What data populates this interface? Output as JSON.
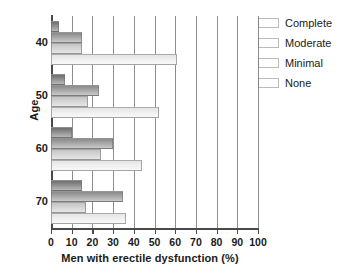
{
  "chart_data": {
    "type": "bar",
    "orientation": "horizontal",
    "title": "",
    "xlabel": "Men with erectile dysfunction (%)",
    "ylabel": "Age",
    "categories": [
      "40",
      "50",
      "60",
      "70"
    ],
    "xlim": [
      0,
      100
    ],
    "xticks": [
      "0",
      "10",
      "20",
      "30",
      "40",
      "50",
      "60",
      "70",
      "80",
      "90",
      "100"
    ],
    "grid": "vertical",
    "legend_position": "top-right",
    "series": [
      {
        "name": "Complete",
        "color": "#8f8f8f",
        "values": [
          4,
          7,
          10,
          15
        ]
      },
      {
        "name": "Moderate",
        "color": "#a6a6a6",
        "values": [
          15,
          23,
          30,
          35
        ]
      },
      {
        "name": "Minimal",
        "color": "#d4d4d4",
        "values": [
          15,
          18,
          24,
          17
        ]
      },
      {
        "name": "None",
        "color": "#efefef",
        "values": [
          61,
          52,
          44,
          36
        ]
      }
    ]
  },
  "axes": {
    "y_title": "Age",
    "x_title": "Men with erectile dysfunction (%)"
  },
  "legend": {
    "items": [
      {
        "label": "Complete"
      },
      {
        "label": "Moderate"
      },
      {
        "label": "Minimal"
      },
      {
        "label": "None"
      }
    ]
  }
}
